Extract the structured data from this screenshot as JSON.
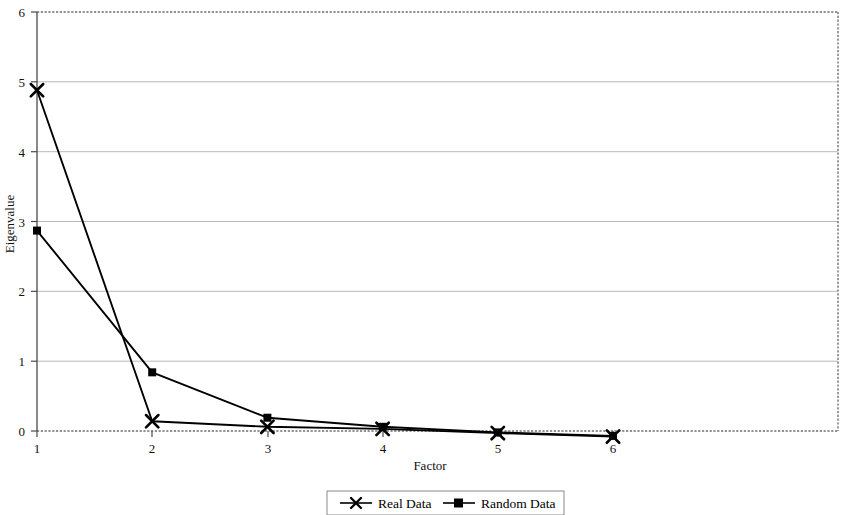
{
  "chart_data": {
    "type": "line",
    "title": "",
    "subtitle": "",
    "xlabel": "Factor",
    "ylabel": "Eigenvalue",
    "x": [
      1,
      2,
      3,
      4,
      5,
      6
    ],
    "xtick_labels": [
      "1",
      "2",
      "3",
      "4",
      "5",
      "6"
    ],
    "ytick_labels": [
      "0",
      "1",
      "2",
      "3",
      "4",
      "5",
      "6"
    ],
    "xlim": [
      1,
      6
    ],
    "ylim": [
      0,
      6
    ],
    "grid": "horizontal",
    "legend_position": "bottom-center",
    "series": [
      {
        "name": "Real Data",
        "marker": "x-cross",
        "color": "#000000",
        "values": [
          4.88,
          0.14,
          0.06,
          0.03,
          -0.03,
          -0.08
        ]
      },
      {
        "name": "Random Data",
        "marker": "square",
        "color": "#000000",
        "values": [
          2.87,
          0.84,
          0.19,
          0.06,
          -0.02,
          -0.07
        ]
      }
    ]
  },
  "legend": {
    "items": [
      {
        "label": "Real Data",
        "marker": "x-cross"
      },
      {
        "label": "Random Data",
        "marker": "square"
      }
    ]
  },
  "axes": {
    "x_title": "Factor",
    "y_title": "Eigenvalue",
    "x_ticks": [
      "1",
      "2",
      "3",
      "4",
      "5",
      "6"
    ],
    "y_ticks": [
      "6",
      "5",
      "4",
      "3",
      "2",
      "1",
      "0"
    ]
  },
  "colors": {
    "series": "#000000",
    "gridline": "#b9b9b9",
    "border": "#6f6f6f",
    "axis": "#4a4a4a",
    "background": "#ffffff"
  }
}
